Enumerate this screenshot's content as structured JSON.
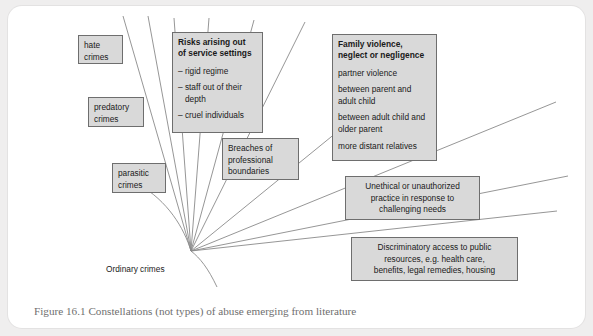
{
  "figure": {
    "caption": "Figure 16.1 Constellations (not types) of abuse emerging from literature",
    "origin_label": "Ordinary crimes",
    "colors": {
      "box_fill": "#d9d9d9",
      "box_border": "#6e6e6e",
      "line": "#808080",
      "page_background": "#efeeee",
      "card_background": "#ffffff",
      "caption_text": "#6f6f6f"
    },
    "nodes": {
      "hate_crimes": {
        "line1": "hate",
        "line2": "crimes"
      },
      "predatory_crimes": {
        "line1": "predatory",
        "line2": "crimes"
      },
      "parasitic_crimes": {
        "line1": "parasitic",
        "line2": "crimes"
      },
      "risks_service_settings": {
        "title_line1": "Risks arising out",
        "title_line2": "of service settings",
        "item1": "– rigid regime",
        "item2_line1": "– staff out of their",
        "item2_line2": "depth",
        "item3": "– cruel individuals"
      },
      "breaches_professional": {
        "line1": "Breaches of",
        "line2": "professional",
        "line3": "boundaries"
      },
      "family_violence": {
        "title_line1": "Family violence,",
        "title_line2": "neglect or negligence",
        "item1": "partner violence",
        "item2_line1": "between parent and",
        "item2_line2": "adult child",
        "item3_line1": "between adult child and",
        "item3_line2": "older parent",
        "item4": "more distant relatives"
      },
      "unethical_practice": {
        "line1": "Unethical or unauthorized",
        "line2": "practice in response to",
        "line3": "challenging needs"
      },
      "discriminatory_access": {
        "line1": "Discriminatory access to public",
        "line2": "resources, e.g. health care,",
        "line3": "benefits, legal remedies, housing"
      }
    }
  }
}
